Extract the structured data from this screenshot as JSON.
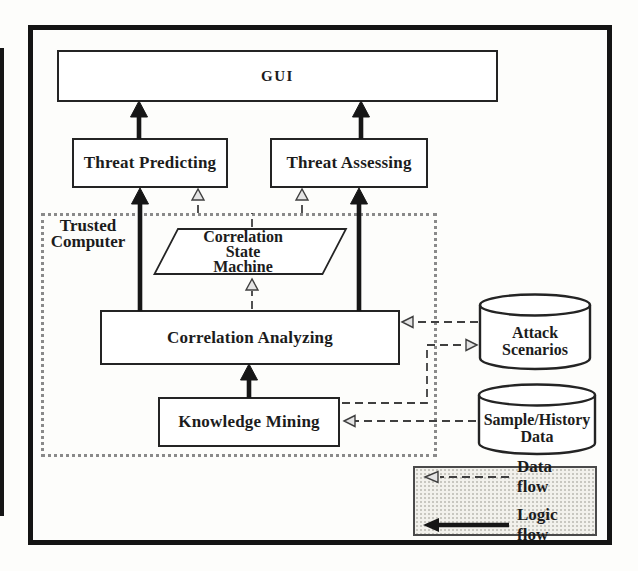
{
  "diagram": {
    "nodes": {
      "gui": {
        "label": "GUI",
        "shape": "rect"
      },
      "threat_predicting": {
        "label": "Threat Predicting",
        "shape": "rect"
      },
      "threat_assessing": {
        "label": "Threat Assessing",
        "shape": "rect"
      },
      "trusted_computer": {
        "label": "Trusted\nComputer",
        "shape": "dotted-container"
      },
      "correlation_state_machine": {
        "label": "Correlation\nState\nMachine",
        "shape": "parallelogram"
      },
      "correlation_analyzing": {
        "label": "Correlation Analyzing",
        "shape": "rect"
      },
      "knowledge_mining": {
        "label": "Knowledge Mining",
        "shape": "rect"
      },
      "attack_scenarios": {
        "label": "Attack\nScenarios",
        "shape": "cylinder"
      },
      "sample_history_data": {
        "label": "Sample/History\nData",
        "shape": "cylinder"
      }
    },
    "edges": [
      {
        "from": "threat_predicting",
        "to": "gui",
        "type": "logic"
      },
      {
        "from": "threat_assessing",
        "to": "gui",
        "type": "logic"
      },
      {
        "from": "correlation_analyzing",
        "to": "threat_predicting",
        "type": "logic"
      },
      {
        "from": "correlation_analyzing",
        "to": "threat_assessing",
        "type": "logic"
      },
      {
        "from": "knowledge_mining",
        "to": "correlation_analyzing",
        "type": "logic"
      },
      {
        "from": "correlation_analyzing",
        "to": "correlation_state_machine",
        "type": "data"
      },
      {
        "from": "correlation_state_machine",
        "to": "threat_predicting",
        "type": "data"
      },
      {
        "from": "correlation_state_machine",
        "to": "threat_assessing",
        "type": "data"
      },
      {
        "from": "attack_scenarios",
        "to": "correlation_analyzing",
        "type": "data"
      },
      {
        "from": "knowledge_mining",
        "to": "attack_scenarios",
        "type": "data"
      },
      {
        "from": "sample_history_data",
        "to": "knowledge_mining",
        "type": "data"
      }
    ],
    "legend": {
      "data_flow": "Data flow",
      "logic_flow": "Logic flow"
    },
    "colors": {
      "ink": "#1c1c1c",
      "dash_line": "#3f3f3f",
      "dotted_border": "#8a8a8a",
      "legend_bg": "#f2f1ec",
      "paper": "#fdfdfb"
    }
  }
}
